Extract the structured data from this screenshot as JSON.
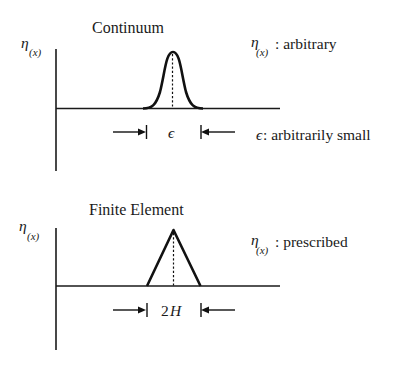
{
  "panels": [
    {
      "id": "continuum",
      "title": "Continuum",
      "axis_label": {
        "symbol": "η",
        "subscript": "(x)"
      },
      "shape": "smooth-bump",
      "dimension_label": "ϵ",
      "annotations": [
        {
          "symbol": "η",
          "subscript": "(x)",
          "text": ": arbitrary"
        },
        {
          "symbol": "ϵ",
          "text": " : arbitrarily small"
        }
      ]
    },
    {
      "id": "finite-element",
      "title": "Finite Element",
      "axis_label": {
        "symbol": "η",
        "subscript": "(x)"
      },
      "shape": "triangle",
      "dimension_label": "2H",
      "dimension_number": "2",
      "dimension_var": "H",
      "annotations": [
        {
          "symbol": "η",
          "subscript": "(x)",
          "text": ": prescribed"
        }
      ]
    }
  ],
  "colors": {
    "ink": "#111111",
    "background": "#ffffff"
  }
}
